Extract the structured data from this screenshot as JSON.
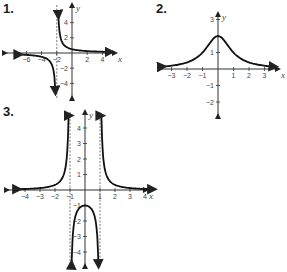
{
  "chart_data": [
    {
      "id": "1",
      "type": "line",
      "title": "1.",
      "xlabel": "x",
      "ylabel": "y",
      "x_ticks": [
        "-6",
        "-4",
        "-2",
        "2",
        "4"
      ],
      "y_ticks": [
        "4",
        "2",
        "-2",
        "-4"
      ],
      "xlim": [
        -7,
        5
      ],
      "ylim": [
        -5,
        5
      ],
      "asymptotes": {
        "vertical": [
          -2
        ],
        "horizontal": [
          0
        ]
      },
      "series": [
        {
          "name": "left branch",
          "x": [
            -7,
            -6,
            -4,
            -3,
            -2.5,
            -2.2
          ],
          "y": [
            -0.2,
            -0.25,
            -0.5,
            -1,
            -2,
            -5
          ]
        },
        {
          "name": "right branch",
          "x": [
            -1.8,
            -1.5,
            -1,
            0,
            2,
            4,
            5
          ],
          "y": [
            5,
            2,
            1,
            0.5,
            0.25,
            0.17,
            0.14
          ]
        }
      ]
    },
    {
      "id": "2",
      "type": "line",
      "title": "2.",
      "xlabel": "x",
      "ylabel": "y",
      "x_ticks": [
        "-3",
        "-2",
        "-1",
        "1",
        "2",
        "3"
      ],
      "y_ticks": [
        "3",
        "1",
        "-1",
        "-2"
      ],
      "xlim": [
        -3.6,
        3.6
      ],
      "ylim": [
        -2.6,
        3.5
      ],
      "series": [
        {
          "name": "curve",
          "x": [
            -3.6,
            -3,
            -2,
            -1,
            0,
            1,
            2,
            3,
            3.6
          ],
          "y": [
            0.14,
            0.2,
            0.4,
            1,
            2,
            1,
            0.4,
            0.2,
            0.14
          ]
        }
      ]
    },
    {
      "id": "3",
      "type": "line",
      "title": "3.",
      "xlabel": "x",
      "ylabel": "y",
      "x_ticks": [
        "-4",
        "-3",
        "-2",
        "-1",
        "1",
        "2",
        "3",
        "4"
      ],
      "y_ticks": [
        "4",
        "3",
        "2",
        "1",
        "-1",
        "-2",
        "-3",
        "-4"
      ],
      "xlim": [
        -4.5,
        4.5
      ],
      "ylim": [
        -4.8,
        4.8
      ],
      "asymptotes": {
        "vertical": [
          -1,
          1
        ],
        "horizontal": [
          0
        ]
      },
      "series": [
        {
          "name": "left branch",
          "x": [
            -4.5,
            -3,
            -2,
            -1.5,
            -1.2,
            -1.05
          ],
          "y": [
            0.05,
            0.13,
            0.33,
            0.8,
            2.3,
            4.8
          ]
        },
        {
          "name": "middle branch",
          "x": [
            -0.9,
            -0.7,
            -0.4,
            0,
            0.4,
            0.7,
            0.9
          ],
          "y": [
            -4.8,
            -2,
            -1.2,
            -1,
            -1.2,
            -2,
            -4.8
          ]
        },
        {
          "name": "right branch",
          "x": [
            1.05,
            1.2,
            1.5,
            2,
            3,
            4.5
          ],
          "y": [
            4.8,
            2.3,
            0.8,
            0.33,
            0.13,
            0.05
          ]
        }
      ]
    }
  ],
  "labels": {
    "g1": "1.",
    "g2": "2.",
    "g3": "3."
  }
}
